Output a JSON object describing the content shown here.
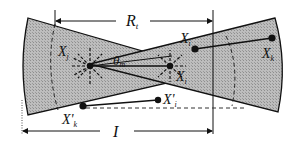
{
  "diagram": {
    "type": "two overlapping sensor/antenna beam wedges",
    "colors": {
      "wedge_fill": "#b4b4b4",
      "stroke": "#111111",
      "background": "#ffffff"
    },
    "labels": {
      "range": "R",
      "range_sub": "t",
      "distance": "I",
      "angle": "θ",
      "angle_sub": "m",
      "xj": "X",
      "xj_sub": "j",
      "xi": "X",
      "xi_sub": "i",
      "xi_center": "X",
      "xi_center_sub": "i",
      "xk": "X",
      "xk_sub": "k",
      "xk_prime": "X'",
      "xk_prime_sub": "k",
      "xi_prime": "X'",
      "xi_prime_sub": "i"
    }
  }
}
